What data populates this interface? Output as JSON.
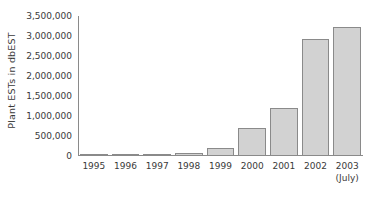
{
  "chart_data": {
    "type": "bar",
    "title": "",
    "subtitle": "",
    "xlabel": "",
    "ylabel": "Plant ESTs in dbEST",
    "categories": [
      "1995",
      "1996",
      "1997",
      "1998",
      "1999",
      "2000",
      "2001",
      "2002",
      "2003"
    ],
    "category_sub_labels": [
      "",
      "",
      "",
      "",
      "",
      "",
      "",
      "",
      "(July)"
    ],
    "values": [
      20000,
      25000,
      50000,
      80000,
      200000,
      710000,
      1200000,
      2920000,
      3220000
    ],
    "ylim": [
      0,
      3500000
    ],
    "y_ticks": [
      0,
      500000,
      1000000,
      1500000,
      2000000,
      2500000,
      3000000,
      3500000
    ],
    "y_tick_labels": [
      "0",
      "500,000",
      "1,000,000",
      "1,500,000",
      "2,000,000",
      "2,500,000",
      "3,000,000",
      "3,500,000"
    ],
    "grid": false,
    "legend": "none",
    "series": [
      {
        "name": "Plant ESTs in dbEST",
        "values": [
          20000,
          25000,
          50000,
          80000,
          200000,
          710000,
          1200000,
          2920000,
          3220000
        ]
      }
    ],
    "colors": {
      "bar_fill": "#d2d2d2",
      "bar_border": "#8a8a8a",
      "axis": "#8a8a8a",
      "text": "#3a3a3a",
      "background": "#ffffff"
    }
  }
}
